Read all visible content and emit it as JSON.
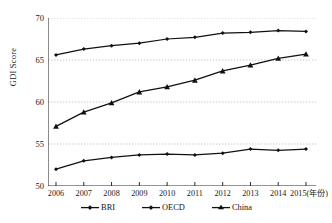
{
  "chart_data": {
    "type": "line",
    "title": "",
    "xlabel": "2015(年份)",
    "ylabel": "GDI Score",
    "x": [
      2006,
      2007,
      2008,
      2009,
      2010,
      2011,
      2012,
      2013,
      2014,
      2015
    ],
    "categories": [
      "2006",
      "2007",
      "2008",
      "2009",
      "2010",
      "2011",
      "2012",
      "2013",
      "2014",
      "2015"
    ],
    "xtick_labels": [
      "2006",
      "2007",
      "2008",
      "2009",
      "2010",
      "2011",
      "2012",
      "2013",
      "2014",
      "2015(年份)"
    ],
    "ytick_labels": [
      "50",
      "55",
      "60",
      "65",
      "70"
    ],
    "yticks": [
      50,
      55,
      60,
      65,
      70
    ],
    "ylim": [
      50,
      70
    ],
    "xlim": [
      2006,
      2015
    ],
    "grid": "horizontal-dotted",
    "legend_position": "bottom-center",
    "series": [
      {
        "name": "BRI",
        "marker": "diamond",
        "color": "#111111",
        "values": [
          65.6,
          66.3,
          66.7,
          67.0,
          67.5,
          67.7,
          68.2,
          68.3,
          68.5,
          68.4
        ]
      },
      {
        "name": "OECD",
        "marker": "diamond",
        "color": "#111111",
        "values": [
          52.0,
          53.0,
          53.4,
          53.7,
          53.8,
          53.7,
          53.9,
          54.4,
          54.25,
          54.4
        ]
      },
      {
        "name": "China",
        "marker": "triangle",
        "color": "#111111",
        "values": [
          57.1,
          58.8,
          59.9,
          61.2,
          61.8,
          62.6,
          63.7,
          64.4,
          65.2,
          65.7
        ]
      }
    ]
  },
  "axes": {
    "y_title": "GDI Score"
  },
  "legend": {
    "items": [
      {
        "label": "BRI"
      },
      {
        "label": "OECD"
      },
      {
        "label": "China"
      }
    ]
  }
}
